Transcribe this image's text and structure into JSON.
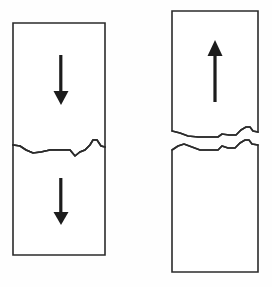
{
  "figure": {
    "background_color": "#fefefe",
    "line_color": "#2b2b2b",
    "arrow_color": "#1c1c1c",
    "stroke_width": 1.6,
    "canvas": {
      "width": 272,
      "height": 287
    }
  },
  "panels": [
    {
      "id": "left-specimen",
      "name": "left-specimen",
      "description": "Rectangular bar with a single irregular horizontal fracture line crossing it",
      "separated": false,
      "bounds": {
        "x": 13,
        "y": 23,
        "width": 92,
        "height": 232
      },
      "fracture_line_y": 146,
      "arrows": [
        {
          "id": "left-upper-arrow",
          "name": "down-arrow-upper",
          "direction": "down",
          "x": 61,
          "y_start": 55,
          "y_end": 105
        },
        {
          "id": "left-lower-arrow",
          "name": "down-arrow-lower",
          "direction": "down",
          "x": 61,
          "y_start": 178,
          "y_end": 225
        }
      ]
    },
    {
      "id": "right-specimen",
      "name": "right-specimen",
      "description": "Rectangular bar broken into two pieces separated by a gap, with matching jagged fracture surfaces",
      "separated": true,
      "bounds": {
        "x": 172,
        "y": 11,
        "width": 86,
        "height": 261
      },
      "upper_piece": {
        "x": 172,
        "y": 11,
        "width": 86,
        "height": 125
      },
      "lower_piece": {
        "x": 172,
        "y": 143,
        "width": 86,
        "height": 129
      },
      "gap_height": 8,
      "arrows": [
        {
          "id": "right-arrow",
          "name": "up-arrow",
          "direction": "up",
          "x": 215,
          "y_start": 102,
          "y_end": 40
        }
      ]
    }
  ],
  "geometry": {
    "left_fracture_points": "13,145 20,146 26,150 33,153 41,152 50,150 62,150 70,150 75,156 80,152 85,150 90,145 93,140 97,140 101,146 105,147",
    "right_upper_fracture_points": "172,131 180,133 188,136 198,137 212,137 218,137 222,134 229,135 236,135 241,130 246,127 250,127 253,131 258,132",
    "right_lower_fracture_points": "172,150 178,146 184,144 192,147 200,150 211,150 218,150 222,146 228,148 235,148 240,143 245,140 249,140 252,144 258,145"
  },
  "labels": {
    "figure_caption": "",
    "left_caption": "",
    "right_caption": ""
  }
}
